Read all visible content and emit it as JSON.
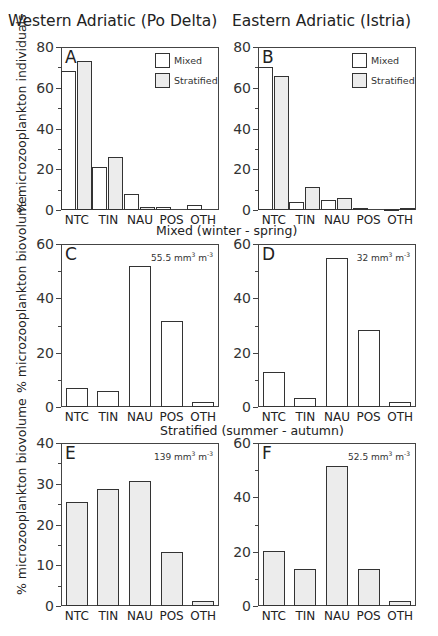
{
  "figure": {
    "column_titles": [
      "Western Adriatic (Po Delta)",
      "Eastern Adriatic (Istria)"
    ],
    "row_titles": [
      "Mixed (winter - spring)",
      "Stratified (summer - autumn)"
    ],
    "ylabels": [
      "% microzooplankton individuals",
      "% microzooplankton biovolume",
      "% microzooplankton biovolume"
    ],
    "legend": [
      {
        "label": "Mixed",
        "fill": "#ffffff"
      },
      {
        "label": "Stratified",
        "fill": "#ececec"
      }
    ],
    "colors": {
      "mixed": "#ffffff",
      "stratified": "#ececec",
      "axis": "#444444"
    }
  },
  "chart_data": [
    {
      "panel": "A",
      "type": "bar",
      "title": "Western Adriatic (Po Delta)",
      "ylabel": "% microzooplankton individuals",
      "ylim": [
        0,
        80
      ],
      "yticks": [
        0,
        20,
        40,
        60,
        80
      ],
      "categories": [
        "NTC",
        "TIN",
        "NAU",
        "POS",
        "OTH"
      ],
      "series": [
        {
          "name": "Mixed",
          "values": [
            68,
            21,
            8,
            1.5,
            2.5
          ]
        },
        {
          "name": "Stratified",
          "values": [
            73,
            26,
            1.5,
            0,
            0
          ]
        }
      ],
      "legend_position": "upper right"
    },
    {
      "panel": "B",
      "type": "bar",
      "title": "Eastern Adriatic (Istria)",
      "ylim": [
        0,
        80
      ],
      "yticks": [
        0,
        20,
        40,
        60,
        80
      ],
      "categories": [
        "NTC",
        "TIN",
        "NAU",
        "POS",
        "OTH"
      ],
      "series": [
        {
          "name": "Mixed",
          "values": [
            70,
            4,
            5,
            1,
            0.5
          ]
        },
        {
          "name": "Stratified",
          "values": [
            66,
            11.5,
            6,
            0,
            1
          ]
        }
      ],
      "legend_position": "upper right"
    },
    {
      "panel": "C",
      "type": "bar",
      "title": "Mixed (winter - spring)",
      "ylabel": "% microzooplankton biovolume",
      "ylim": [
        0,
        60
      ],
      "yticks": [
        0,
        20,
        40,
        60
      ],
      "categories": [
        "NTC",
        "TIN",
        "NAU",
        "POS",
        "OTH"
      ],
      "series": [
        {
          "name": "Mixed",
          "values": [
            7,
            6,
            52,
            31.5,
            1.7
          ]
        }
      ],
      "annotation": {
        "value": "55.5",
        "unit": "mm",
        "sup1": "3",
        "unit2": "m",
        "sup2": "-3"
      }
    },
    {
      "panel": "D",
      "type": "bar",
      "title": "Mixed (winter - spring)",
      "ylim": [
        0,
        60
      ],
      "yticks": [
        0,
        20,
        40,
        60
      ],
      "categories": [
        "NTC",
        "TIN",
        "NAU",
        "POS",
        "OTH"
      ],
      "series": [
        {
          "name": "Mixed",
          "values": [
            12.7,
            3.3,
            55,
            28.3,
            1.8
          ]
        }
      ],
      "annotation": {
        "value": "32",
        "unit": "mm",
        "sup1": "3",
        "unit2": "m",
        "sup2": "-3"
      }
    },
    {
      "panel": "E",
      "type": "bar",
      "title": "Stratified (summer - autumn)",
      "ylabel": "% microzooplankton biovolume",
      "ylim": [
        0,
        40
      ],
      "yticks": [
        0,
        10,
        20,
        30,
        40
      ],
      "categories": [
        "NTC",
        "TIN",
        "NAU",
        "POS",
        "OTH"
      ],
      "series": [
        {
          "name": "Stratified",
          "values": [
            25.5,
            28.6,
            30.7,
            13.3,
            1.3
          ]
        }
      ],
      "annotation": {
        "value": "139",
        "unit": "mm",
        "sup1": "3",
        "unit2": "m",
        "sup2": "-3"
      }
    },
    {
      "panel": "F",
      "type": "bar",
      "title": "Stratified (summer - autumn)",
      "ylim": [
        0,
        60
      ],
      "yticks": [
        0,
        20,
        40,
        60
      ],
      "categories": [
        "NTC",
        "TIN",
        "NAU",
        "POS",
        "OTH"
      ],
      "series": [
        {
          "name": "Stratified",
          "values": [
            20.3,
            13.5,
            51.7,
            13.5,
            2
          ]
        }
      ],
      "annotation": {
        "value": "52.5",
        "unit": "mm",
        "sup1": "3",
        "unit2": "m",
        "sup2": "-3"
      }
    }
  ]
}
